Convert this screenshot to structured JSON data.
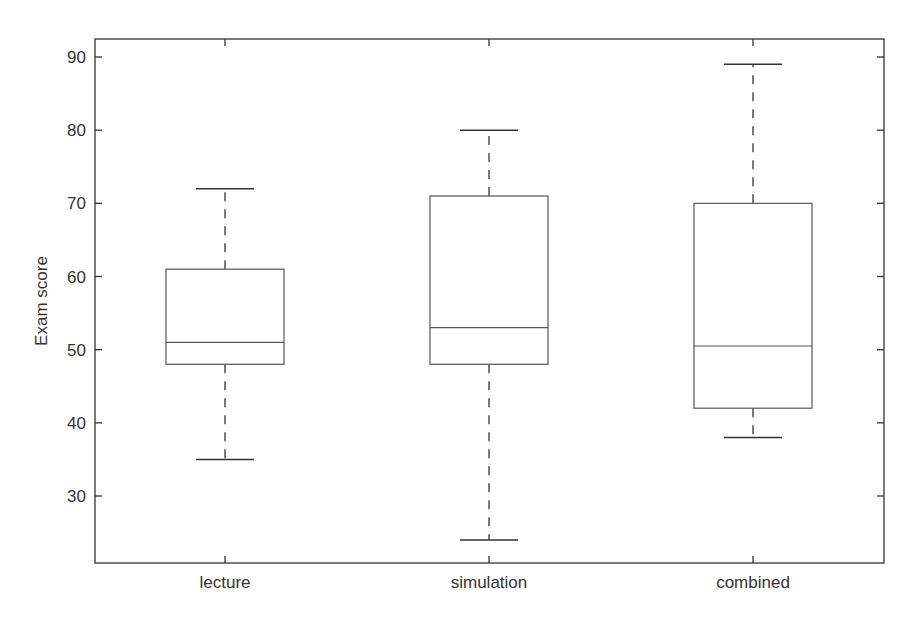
{
  "chart_data": {
    "type": "boxplot",
    "title": "",
    "xlabel": "",
    "ylabel": "Exam score",
    "ylim": [
      20.5,
      92.5
    ],
    "yticks": [
      30,
      40,
      50,
      60,
      70,
      80,
      90
    ],
    "grid": false,
    "legend": null,
    "categories": [
      "lecture",
      "simulation",
      "combined"
    ],
    "series": [
      {
        "name": "lecture",
        "min": 35,
        "q1": 48,
        "median": 51,
        "q3": 61,
        "max": 72
      },
      {
        "name": "simulation",
        "min": 24,
        "q1": 48,
        "median": 53,
        "q3": 71,
        "max": 80
      },
      {
        "name": "combined",
        "min": 38,
        "q1": 42,
        "median": 50.5,
        "q3": 70,
        "max": 89
      }
    ]
  }
}
